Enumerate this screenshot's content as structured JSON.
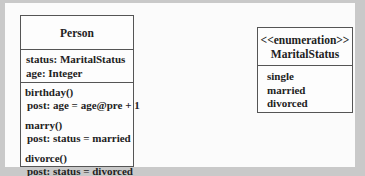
{
  "diagram": {
    "type": "uml-class-diagram",
    "colors": {
      "frame": "#c9c9c9",
      "page": "#fbfbfb",
      "border": "#555555",
      "text": "#222222"
    },
    "person": {
      "name": "Person",
      "attributes": [
        "status: MaritalStatus",
        "age: Integer"
      ],
      "operations": [
        {
          "signature": "birthday()",
          "post": "post: age = age@pre + 1"
        },
        {
          "signature": "marry()",
          "post": "post: status = married"
        },
        {
          "signature": "divorce()",
          "post": "post: status = divorced"
        }
      ]
    },
    "marital_status": {
      "stereotype": "<<enumeration>>",
      "name": "MaritalStatus",
      "literals": [
        "single",
        "married",
        "divorced"
      ]
    }
  }
}
